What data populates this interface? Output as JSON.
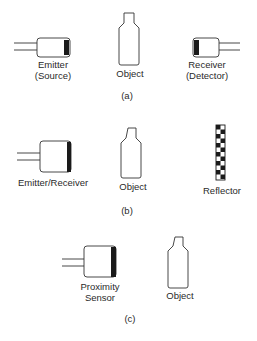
{
  "panel_a": {
    "caption": "(a)",
    "emitter": {
      "line1": "Emitter",
      "line2": "(Source)"
    },
    "object": {
      "label": "Object"
    },
    "receiver": {
      "line1": "Receiver",
      "line2": "(Detector)"
    }
  },
  "panel_b": {
    "caption": "(b)",
    "emitter_receiver": {
      "label": "Emitter/Receiver"
    },
    "object": {
      "label": "Object"
    },
    "reflector": {
      "label": "Reflector"
    }
  },
  "panel_c": {
    "caption": "(c)",
    "proximity_sensor": {
      "line1": "Proximity",
      "line2": "Sensor"
    },
    "object": {
      "label": "Object"
    }
  },
  "colors": {
    "stroke": "#333333",
    "lens": "#1a1a1a",
    "background": "#ffffff"
  }
}
